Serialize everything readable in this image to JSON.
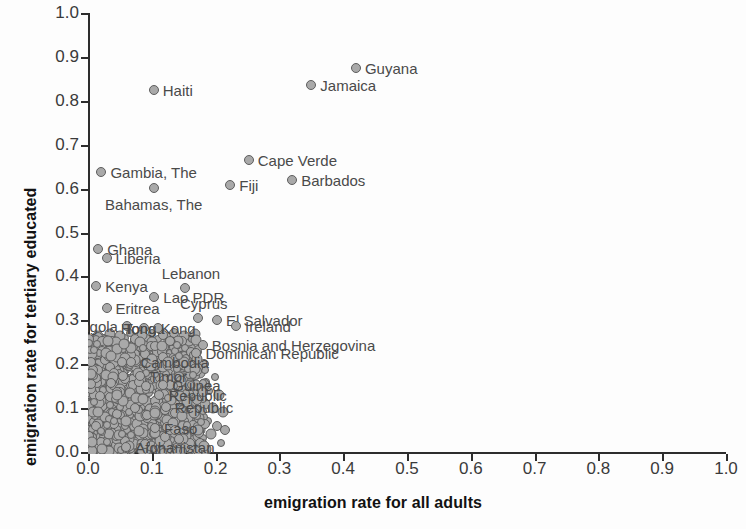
{
  "chart_data": {
    "type": "scatter",
    "title": "",
    "xlabel": "emigration rate for all adults",
    "ylabel": "emigration rate for tertiary educated",
    "xlim": [
      0.0,
      1.0
    ],
    "ylim": [
      0.0,
      1.0
    ],
    "xticks": [
      "0.0",
      "0.1",
      "0.2",
      "0.3",
      "0.4",
      "0.5",
      "0.6",
      "0.7",
      "0.8",
      "0.9",
      "1.0"
    ],
    "yticks": [
      "0.0",
      "0.1",
      "0.2",
      "0.3",
      "0.4",
      "0.5",
      "0.6",
      "0.7",
      "0.8",
      "0.9",
      "1.0"
    ],
    "grid": false,
    "legend": "none",
    "marker_color": "#a9a9a9",
    "marker_edge_color": "#5e5e5e",
    "labeled_points": [
      {
        "name": "Guyana",
        "x": 0.42,
        "y": 0.875,
        "pos": "r"
      },
      {
        "name": "Jamaica",
        "x": 0.35,
        "y": 0.835,
        "pos": "r"
      },
      {
        "name": "Haiti",
        "x": 0.103,
        "y": 0.825,
        "pos": "r"
      },
      {
        "name": "Cape Verde",
        "x": 0.252,
        "y": 0.665,
        "pos": "r"
      },
      {
        "name": "Gambia, The",
        "x": 0.021,
        "y": 0.637,
        "pos": "r"
      },
      {
        "name": "Barbados",
        "x": 0.32,
        "y": 0.62,
        "pos": "r"
      },
      {
        "name": "Fiji",
        "x": 0.223,
        "y": 0.608,
        "pos": "r"
      },
      {
        "name": "Bahamas, The",
        "x": 0.103,
        "y": 0.602,
        "pos": "bc"
      },
      {
        "name": "Ghana",
        "x": 0.016,
        "y": 0.462,
        "pos": "r"
      },
      {
        "name": "Liberia",
        "x": 0.029,
        "y": 0.443,
        "pos": "r"
      },
      {
        "name": "Kenya",
        "x": 0.013,
        "y": 0.378,
        "pos": "r"
      },
      {
        "name": "Lebanon",
        "x": 0.152,
        "y": 0.373,
        "pos": "tc"
      },
      {
        "name": "Lao PDR",
        "x": 0.104,
        "y": 0.352,
        "pos": "r"
      },
      {
        "name": "Eritrea",
        "x": 0.029,
        "y": 0.327,
        "pos": "r"
      },
      {
        "name": "Cyprus",
        "x": 0.172,
        "y": 0.305,
        "pos": "tc"
      },
      {
        "name": "El Salvador",
        "x": 0.202,
        "y": 0.3,
        "pos": "r"
      },
      {
        "name": "Angola",
        "x": 0.061,
        "y": 0.287,
        "pos": "l"
      },
      {
        "name": "Tonga",
        "x": 0.088,
        "y": 0.282,
        "pos": "c"
      },
      {
        "name": "Hong Kong",
        "x": 0.11,
        "y": 0.282,
        "pos": "c"
      },
      {
        "name": "Ireland",
        "x": 0.232,
        "y": 0.288,
        "pos": "r"
      },
      {
        "name": "Bosnia and Herzegovina",
        "x": 0.18,
        "y": 0.243,
        "pos": "r"
      },
      {
        "name": "Dominican Republic",
        "x": 0.17,
        "y": 0.225,
        "pos": "r"
      },
      {
        "name": "Cambodia",
        "x": 0.068,
        "y": 0.205,
        "pos": "r"
      },
      {
        "name": "Timor",
        "x": 0.082,
        "y": 0.172,
        "pos": "r"
      },
      {
        "name": "Guinea",
        "x": 0.118,
        "y": 0.152,
        "pos": "r"
      },
      {
        "name": "Republic",
        "x": 0.112,
        "y": 0.13,
        "pos": "r"
      },
      {
        "name": "Republic",
        "x": 0.122,
        "y": 0.103,
        "pos": "r"
      },
      {
        "name": "Faso",
        "x": 0.105,
        "y": 0.055,
        "pos": "r"
      },
      {
        "name": "Afghanistan",
        "x": 0.06,
        "y": 0.012,
        "pos": "r"
      }
    ],
    "cluster_note": "Dense overlapping mass of several hundred country markers occupying x 0.00-0.20, y 0.00-0.26",
    "cluster_points": [
      [
        0.004,
        0.232
      ],
      [
        0.012,
        0.226
      ],
      [
        0.02,
        0.229
      ],
      [
        0.028,
        0.236
      ],
      [
        0.036,
        0.224
      ],
      [
        0.045,
        0.231
      ],
      [
        0.053,
        0.238
      ],
      [
        0.061,
        0.227
      ],
      [
        0.07,
        0.234
      ],
      [
        0.078,
        0.24
      ],
      [
        0.087,
        0.228
      ],
      [
        0.095,
        0.235
      ],
      [
        0.104,
        0.241
      ],
      [
        0.112,
        0.23
      ],
      [
        0.121,
        0.237
      ],
      [
        0.129,
        0.225
      ],
      [
        0.138,
        0.233
      ],
      [
        0.146,
        0.239
      ],
      [
        0.155,
        0.228
      ],
      [
        0.163,
        0.236
      ],
      [
        0.006,
        0.214
      ],
      [
        0.014,
        0.22
      ],
      [
        0.023,
        0.208
      ],
      [
        0.031,
        0.216
      ],
      [
        0.04,
        0.222
      ],
      [
        0.048,
        0.21
      ],
      [
        0.057,
        0.218
      ],
      [
        0.065,
        0.205
      ],
      [
        0.074,
        0.213
      ],
      [
        0.082,
        0.219
      ],
      [
        0.091,
        0.207
      ],
      [
        0.099,
        0.215
      ],
      [
        0.108,
        0.221
      ],
      [
        0.116,
        0.209
      ],
      [
        0.125,
        0.217
      ],
      [
        0.133,
        0.204
      ],
      [
        0.142,
        0.212
      ],
      [
        0.15,
        0.218
      ],
      [
        0.159,
        0.206
      ],
      [
        0.167,
        0.214
      ],
      [
        0.003,
        0.196
      ],
      [
        0.011,
        0.202
      ],
      [
        0.019,
        0.19
      ],
      [
        0.027,
        0.198
      ],
      [
        0.035,
        0.188
      ],
      [
        0.043,
        0.194
      ],
      [
        0.052,
        0.2
      ],
      [
        0.06,
        0.186
      ],
      [
        0.069,
        0.192
      ],
      [
        0.077,
        0.199
      ],
      [
        0.086,
        0.187
      ],
      [
        0.094,
        0.195
      ],
      [
        0.102,
        0.201
      ],
      [
        0.111,
        0.189
      ],
      [
        0.119,
        0.197
      ],
      [
        0.128,
        0.185
      ],
      [
        0.136,
        0.193
      ],
      [
        0.144,
        0.199
      ],
      [
        0.153,
        0.187
      ],
      [
        0.161,
        0.195
      ],
      [
        0.005,
        0.176
      ],
      [
        0.013,
        0.182
      ],
      [
        0.021,
        0.17
      ],
      [
        0.03,
        0.178
      ],
      [
        0.038,
        0.168
      ],
      [
        0.046,
        0.174
      ],
      [
        0.055,
        0.18
      ],
      [
        0.063,
        0.166
      ],
      [
        0.072,
        0.172
      ],
      [
        0.08,
        0.179
      ],
      [
        0.089,
        0.167
      ],
      [
        0.097,
        0.175
      ],
      [
        0.106,
        0.181
      ],
      [
        0.114,
        0.169
      ],
      [
        0.123,
        0.177
      ],
      [
        0.131,
        0.165
      ],
      [
        0.139,
        0.173
      ],
      [
        0.148,
        0.179
      ],
      [
        0.156,
        0.167
      ],
      [
        0.165,
        0.175
      ],
      [
        0.002,
        0.156
      ],
      [
        0.01,
        0.162
      ],
      [
        0.018,
        0.15
      ],
      [
        0.026,
        0.158
      ],
      [
        0.034,
        0.148
      ],
      [
        0.042,
        0.154
      ],
      [
        0.051,
        0.16
      ],
      [
        0.059,
        0.146
      ],
      [
        0.068,
        0.152
      ],
      [
        0.076,
        0.159
      ],
      [
        0.085,
        0.147
      ],
      [
        0.093,
        0.155
      ],
      [
        0.101,
        0.161
      ],
      [
        0.11,
        0.149
      ],
      [
        0.118,
        0.157
      ],
      [
        0.126,
        0.145
      ],
      [
        0.135,
        0.153
      ],
      [
        0.143,
        0.159
      ],
      [
        0.152,
        0.147
      ],
      [
        0.16,
        0.155
      ],
      [
        0.004,
        0.136
      ],
      [
        0.012,
        0.142
      ],
      [
        0.02,
        0.13
      ],
      [
        0.029,
        0.138
      ],
      [
        0.037,
        0.128
      ],
      [
        0.045,
        0.134
      ],
      [
        0.054,
        0.14
      ],
      [
        0.062,
        0.126
      ],
      [
        0.071,
        0.132
      ],
      [
        0.079,
        0.139
      ],
      [
        0.088,
        0.127
      ],
      [
        0.096,
        0.135
      ],
      [
        0.105,
        0.141
      ],
      [
        0.113,
        0.129
      ],
      [
        0.122,
        0.137
      ],
      [
        0.13,
        0.125
      ],
      [
        0.138,
        0.133
      ],
      [
        0.147,
        0.139
      ],
      [
        0.155,
        0.127
      ],
      [
        0.164,
        0.135
      ],
      [
        0.006,
        0.116
      ],
      [
        0.014,
        0.122
      ],
      [
        0.022,
        0.11
      ],
      [
        0.031,
        0.118
      ],
      [
        0.039,
        0.108
      ],
      [
        0.047,
        0.114
      ],
      [
        0.056,
        0.12
      ],
      [
        0.064,
        0.106
      ],
      [
        0.073,
        0.112
      ],
      [
        0.081,
        0.119
      ],
      [
        0.09,
        0.107
      ],
      [
        0.098,
        0.115
      ],
      [
        0.107,
        0.121
      ],
      [
        0.115,
        0.109
      ],
      [
        0.124,
        0.117
      ],
      [
        0.132,
        0.105
      ],
      [
        0.141,
        0.113
      ],
      [
        0.149,
        0.119
      ],
      [
        0.158,
        0.107
      ],
      [
        0.166,
        0.115
      ],
      [
        0.003,
        0.096
      ],
      [
        0.011,
        0.102
      ],
      [
        0.019,
        0.09
      ],
      [
        0.028,
        0.098
      ],
      [
        0.036,
        0.088
      ],
      [
        0.044,
        0.094
      ],
      [
        0.053,
        0.1
      ],
      [
        0.061,
        0.086
      ],
      [
        0.07,
        0.092
      ],
      [
        0.078,
        0.099
      ],
      [
        0.087,
        0.087
      ],
      [
        0.095,
        0.095
      ],
      [
        0.104,
        0.101
      ],
      [
        0.112,
        0.089
      ],
      [
        0.121,
        0.097
      ],
      [
        0.129,
        0.085
      ],
      [
        0.137,
        0.093
      ],
      [
        0.146,
        0.099
      ],
      [
        0.154,
        0.087
      ],
      [
        0.162,
        0.095
      ],
      [
        0.005,
        0.076
      ],
      [
        0.013,
        0.082
      ],
      [
        0.021,
        0.07
      ],
      [
        0.03,
        0.078
      ],
      [
        0.038,
        0.068
      ],
      [
        0.046,
        0.074
      ],
      [
        0.055,
        0.08
      ],
      [
        0.063,
        0.066
      ],
      [
        0.072,
        0.072
      ],
      [
        0.08,
        0.079
      ],
      [
        0.089,
        0.067
      ],
      [
        0.097,
        0.075
      ],
      [
        0.106,
        0.081
      ],
      [
        0.114,
        0.069
      ],
      [
        0.123,
        0.077
      ],
      [
        0.131,
        0.065
      ],
      [
        0.14,
        0.073
      ],
      [
        0.148,
        0.079
      ],
      [
        0.157,
        0.067
      ],
      [
        0.165,
        0.075
      ],
      [
        0.002,
        0.056
      ],
      [
        0.01,
        0.062
      ],
      [
        0.018,
        0.05
      ],
      [
        0.027,
        0.058
      ],
      [
        0.035,
        0.048
      ],
      [
        0.043,
        0.054
      ],
      [
        0.052,
        0.06
      ],
      [
        0.06,
        0.046
      ],
      [
        0.069,
        0.052
      ],
      [
        0.077,
        0.059
      ],
      [
        0.086,
        0.047
      ],
      [
        0.094,
        0.055
      ],
      [
        0.103,
        0.061
      ],
      [
        0.111,
        0.049
      ],
      [
        0.12,
        0.057
      ],
      [
        0.128,
        0.045
      ],
      [
        0.136,
        0.053
      ],
      [
        0.145,
        0.059
      ],
      [
        0.153,
        0.047
      ],
      [
        0.161,
        0.055
      ],
      [
        0.004,
        0.036
      ],
      [
        0.012,
        0.042
      ],
      [
        0.02,
        0.03
      ],
      [
        0.029,
        0.038
      ],
      [
        0.037,
        0.028
      ],
      [
        0.045,
        0.034
      ],
      [
        0.054,
        0.04
      ],
      [
        0.062,
        0.026
      ],
      [
        0.071,
        0.032
      ],
      [
        0.079,
        0.039
      ],
      [
        0.088,
        0.027
      ],
      [
        0.096,
        0.035
      ],
      [
        0.105,
        0.041
      ],
      [
        0.113,
        0.029
      ],
      [
        0.122,
        0.037
      ],
      [
        0.13,
        0.025
      ],
      [
        0.139,
        0.033
      ],
      [
        0.147,
        0.039
      ],
      [
        0.156,
        0.027
      ],
      [
        0.164,
        0.035
      ],
      [
        0.006,
        0.016
      ],
      [
        0.014,
        0.022
      ],
      [
        0.022,
        0.01
      ],
      [
        0.031,
        0.018
      ],
      [
        0.039,
        0.008
      ],
      [
        0.047,
        0.014
      ],
      [
        0.056,
        0.02
      ],
      [
        0.064,
        0.006
      ],
      [
        0.073,
        0.012
      ],
      [
        0.081,
        0.019
      ],
      [
        0.09,
        0.007
      ],
      [
        0.098,
        0.015
      ],
      [
        0.107,
        0.021
      ],
      [
        0.115,
        0.009
      ],
      [
        0.124,
        0.017
      ],
      [
        0.132,
        0.005
      ],
      [
        0.141,
        0.013
      ],
      [
        0.149,
        0.019
      ],
      [
        0.158,
        0.007
      ],
      [
        0.166,
        0.015
      ],
      [
        0.008,
        0.245
      ],
      [
        0.024,
        0.248
      ],
      [
        0.04,
        0.243
      ],
      [
        0.056,
        0.25
      ],
      [
        0.072,
        0.244
      ],
      [
        0.09,
        0.249
      ],
      [
        0.106,
        0.245
      ],
      [
        0.124,
        0.251
      ],
      [
        0.14,
        0.246
      ],
      [
        0.158,
        0.252
      ],
      [
        0.009,
        0.254
      ],
      [
        0.025,
        0.258
      ],
      [
        0.041,
        0.256
      ],
      [
        0.058,
        0.26
      ],
      [
        0.075,
        0.255
      ],
      [
        0.092,
        0.259
      ],
      [
        0.109,
        0.257
      ],
      [
        0.127,
        0.261
      ],
      [
        0.143,
        0.256
      ],
      [
        0.161,
        0.259
      ],
      [
        0.016,
        0.265
      ],
      [
        0.034,
        0.268
      ],
      [
        0.05,
        0.264
      ],
      [
        0.066,
        0.27
      ],
      [
        0.084,
        0.266
      ],
      [
        0.1,
        0.272
      ],
      [
        0.118,
        0.267
      ],
      [
        0.135,
        0.271
      ],
      [
        0.151,
        0.265
      ],
      [
        0.168,
        0.269
      ],
      [
        0.007,
        0.186
      ],
      [
        0.015,
        0.144
      ],
      [
        0.023,
        0.104
      ],
      [
        0.033,
        0.064
      ],
      [
        0.041,
        0.024
      ],
      [
        0.049,
        0.184
      ],
      [
        0.058,
        0.124
      ],
      [
        0.066,
        0.084
      ],
      [
        0.075,
        0.044
      ],
      [
        0.083,
        0.164
      ],
      [
        0.092,
        0.114
      ],
      [
        0.1,
        0.074
      ],
      [
        0.109,
        0.034
      ],
      [
        0.117,
        0.194
      ],
      [
        0.126,
        0.154
      ],
      [
        0.134,
        0.094
      ],
      [
        0.143,
        0.054
      ],
      [
        0.151,
        0.174
      ],
      [
        0.16,
        0.134
      ],
      [
        0.168,
        0.094
      ],
      [
        0.171,
        0.21
      ],
      [
        0.176,
        0.18
      ],
      [
        0.172,
        0.15
      ],
      [
        0.178,
        0.12
      ],
      [
        0.174,
        0.09
      ],
      [
        0.18,
        0.06
      ],
      [
        0.175,
        0.03
      ],
      [
        0.182,
        0.2
      ],
      [
        0.185,
        0.16
      ],
      [
        0.183,
        0.11
      ],
      [
        0.188,
        0.07
      ],
      [
        0.19,
        0.14
      ],
      [
        0.193,
        0.04
      ],
      [
        0.196,
        0.1
      ],
      [
        0.199,
        0.17
      ],
      [
        0.202,
        0.06
      ],
      [
        0.205,
        0.13
      ],
      [
        0.208,
        0.02
      ],
      [
        0.212,
        0.09
      ],
      [
        0.215,
        0.05
      ],
      [
        0.001,
        0.205
      ],
      [
        0.001,
        0.165
      ],
      [
        0.001,
        0.125
      ],
      [
        0.001,
        0.085
      ],
      [
        0.001,
        0.045
      ],
      [
        0.001,
        0.018
      ],
      [
        0.002,
        0.24
      ],
      [
        0.002,
        0.185
      ],
      [
        0.002,
        0.145
      ],
      [
        0.002,
        0.105
      ]
    ]
  }
}
